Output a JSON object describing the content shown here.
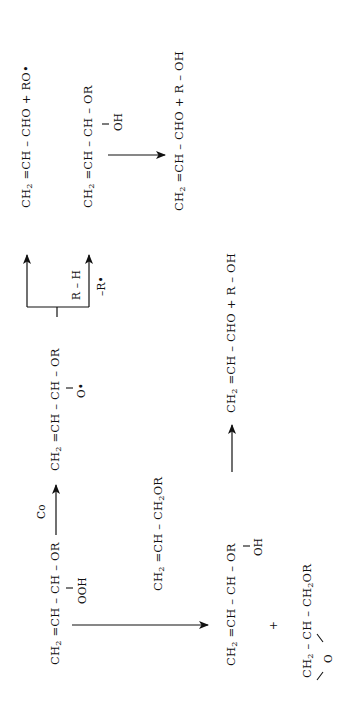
{
  "diagram": {
    "orientation": "rotated -90deg (text reads bottom-to-top)",
    "reactant": {
      "main": [
        "CH",
        "2",
        " =CH – CH – OR"
      ],
      "substituent": "OOH"
    },
    "catalyst_label": "Co",
    "alkoxy_radical": {
      "main": [
        "CH",
        "2",
        " =CH – CH – OR"
      ],
      "substituent": "O•"
    },
    "branch_upper": {
      "product": [
        "CH",
        "2",
        " =CH – CHO + RO•"
      ]
    },
    "branch_lower": {
      "reagent_above": "R – H",
      "reagent_below": "–R•",
      "intermediate": {
        "main": [
          "CH",
          "2",
          " =CH – CH – OR"
        ],
        "substituent": "OH"
      },
      "product": [
        "CH",
        "2",
        " =CH – CHO + R – OH"
      ]
    },
    "epoxidation": {
      "substrate": [
        "CH",
        "2",
        " =CH – CH",
        "2",
        "OR"
      ],
      "hydroxy_product": {
        "main": [
          "CH",
          "2",
          " =CH – CH – OR"
        ],
        "substituent": "OH"
      },
      "plus": "+",
      "epoxide": {
        "main": [
          "CH",
          "2",
          " – CH – CH",
          "2",
          "OR"
        ],
        "bridge": "O"
      },
      "final_product": [
        "CH",
        "2",
        " =CH – CHO + R – OH"
      ]
    }
  }
}
